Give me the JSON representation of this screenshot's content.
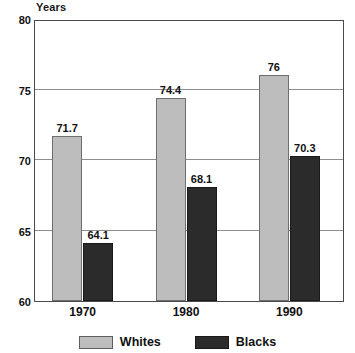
{
  "chart_data": {
    "type": "bar",
    "title": "",
    "subtitle": "",
    "xlabel": "",
    "ylabel": "Years",
    "categories": [
      "1970",
      "1980",
      "1990"
    ],
    "series": [
      {
        "name": "Whites",
        "color": "#bdbdbd",
        "values": [
          71.7,
          74.4,
          76
        ]
      },
      {
        "name": "Blacks",
        "color": "#2b2b2b",
        "values": [
          64.1,
          68.1,
          70.3
        ]
      }
    ],
    "value_labels": {
      "Whites": [
        "71.7",
        "74.4",
        "76"
      ],
      "Blacks": [
        "64.1",
        "68.1",
        "70.3"
      ]
    },
    "ylim": [
      60,
      80
    ],
    "yticks": [
      60,
      65,
      70,
      75,
      80
    ],
    "ytick_labels": [
      "60",
      "65",
      "70",
      "75",
      "80"
    ],
    "grid": true,
    "grid_axis": "y",
    "legend_position": "bottom",
    "frame": true
  },
  "axis": {
    "y_unit_label": "Years"
  },
  "legend": {
    "items": [
      {
        "label": "Whites",
        "swatch": "legend-swatch-whites"
      },
      {
        "label": "Blacks",
        "swatch": "legend-swatch-blacks"
      }
    ]
  }
}
